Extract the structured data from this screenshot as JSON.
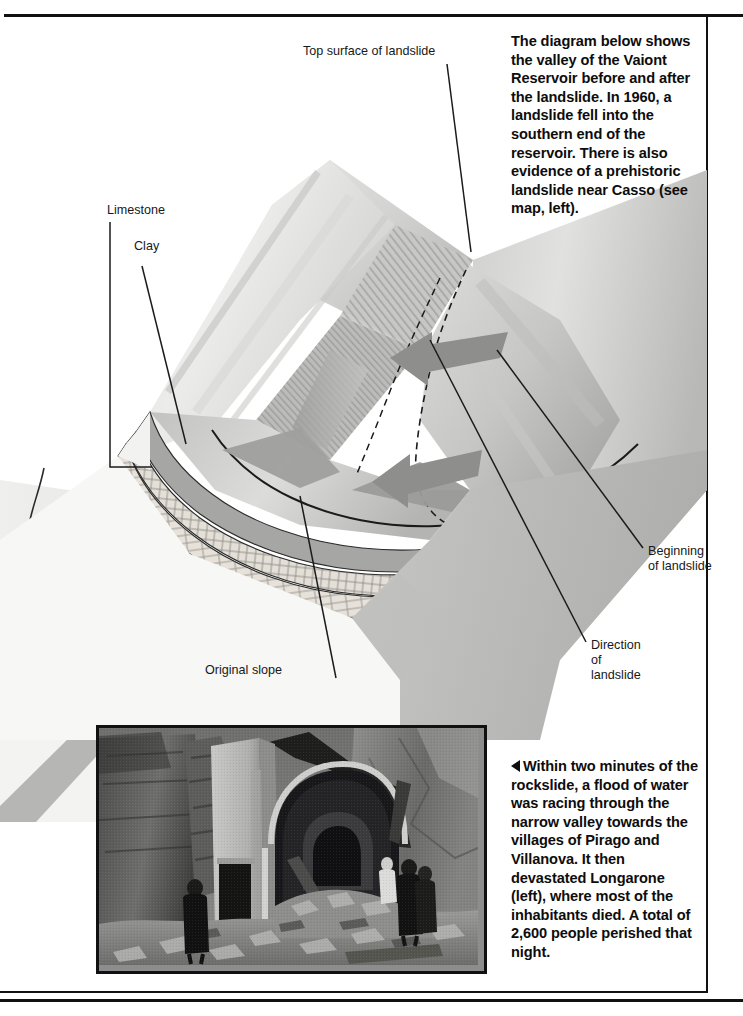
{
  "page": {
    "background_color": "#ffffff",
    "rule_color": "#111111",
    "width": 743,
    "height": 1016
  },
  "intro": {
    "text": "The diagram below shows the valley of the Vaiont Reservoir before and after the landslide. In 1960, a landslide fell into the southern end of the reservoir. There is also evidence of a prehistoric landslide near Casso (see map, left)."
  },
  "caption": {
    "marker": "◀",
    "text": "Within two minutes of the rockslide, a flood of water was racing through the narrow valley towards the villages of Pirago and Villanova. It then devastated Longarone (left), where most of the inhabitants died. A total of 2,600 people perished that night."
  },
  "diagram": {
    "name": "vaiont-valley-block-diagram",
    "callouts": [
      {
        "id": "top-surface",
        "label": "Top surface of landslide"
      },
      {
        "id": "limestone",
        "label": "Limestone"
      },
      {
        "id": "clay",
        "label": "Clay"
      },
      {
        "id": "beginning",
        "label": "Beginning\nof landslide"
      },
      {
        "id": "direction",
        "label": "Direction\nof\nlandslide"
      },
      {
        "id": "original-slope",
        "label": "Original slope"
      }
    ],
    "colors": {
      "block_top_light": "#e3e3e1",
      "block_mid": "#c9c9c7",
      "block_shadow": "#9d9d9b",
      "arrow": "#8e8e8c",
      "limestone_band": "#dedad2",
      "clay_band": "#a3a3a1",
      "outline": "#1b1b1b",
      "dashed_outline": "#1b1b1b"
    },
    "arrows": [
      {
        "id": "arrow-upper",
        "meaning": "direction-of-landslide"
      },
      {
        "id": "arrow-lower",
        "meaning": "direction-of-landslide"
      }
    ]
  },
  "photo": {
    "name": "longarone-ruins-photograph",
    "alt": "Black and white photograph of a ruined church facade surrounded by rubble, with people standing amid the debris and steep valley walls behind."
  },
  "map_fragment": {
    "name": "vaiont-locator-map-fragment",
    "alt": "Partial locator map with river course and shaded reservoir, continuing off the left edge of the page."
  }
}
